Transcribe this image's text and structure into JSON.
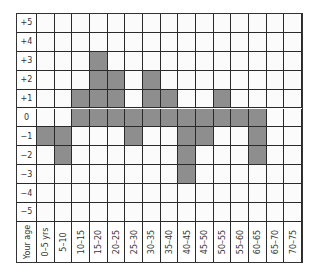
{
  "chart_data": {
    "type": "heatmap",
    "title": "",
    "xlabel": "Your age",
    "ylabel": "",
    "rows": [
      "+5",
      "+4",
      "+3",
      "+2",
      "+1",
      "0",
      "−1",
      "−2",
      "−3",
      "−4",
      "−5"
    ],
    "columns": [
      "0–5 yrs",
      "5–10",
      "10–15",
      "15–20",
      "20–25",
      "25–30",
      "30–35",
      "35–40",
      "40–45",
      "45–50",
      "50–55",
      "55–60",
      "60–65",
      "65–70",
      "70–75"
    ],
    "filled_cells": {
      "+5": [],
      "+4": [],
      "+3": [
        "15–20"
      ],
      "+2": [
        "15–20",
        "20–25",
        "30–35"
      ],
      "+1": [
        "10–15",
        "15–20",
        "20–25",
        "30–35",
        "35–40",
        "50–55"
      ],
      "0": [
        "10–15",
        "15–20",
        "20–25",
        "25–30",
        "30–35",
        "35–40",
        "40–45",
        "45–50",
        "50–55",
        "55–60",
        "60–65"
      ],
      "−1": [
        "0–5 yrs",
        "5–10",
        "25–30",
        "40–45",
        "45–50",
        "60–65"
      ],
      "−2": [
        "5–10",
        "40–45",
        "60–65"
      ],
      "−3": [
        "40–45"
      ],
      "−4": [],
      "−5": []
    },
    "values_by_age": [
      {
        "age": "0–5 yrs",
        "from": 0,
        "to": -1
      },
      {
        "age": "5–10",
        "from": 0,
        "to": -2
      },
      {
        "age": "10–15",
        "from": 0,
        "to": 1
      },
      {
        "age": "15–20",
        "from": 0,
        "to": 3
      },
      {
        "age": "20–25",
        "from": 0,
        "to": 2
      },
      {
        "age": "25–30",
        "from": 0,
        "to": -1
      },
      {
        "age": "30–35",
        "from": 0,
        "to": 2
      },
      {
        "age": "35–40",
        "from": 0,
        "to": 1
      },
      {
        "age": "40–45",
        "from": 0,
        "to": -3
      },
      {
        "age": "45–50",
        "from": 0,
        "to": -1
      },
      {
        "age": "50–55",
        "from": 0,
        "to": 1
      },
      {
        "age": "55–60",
        "from": 0,
        "to": 0
      },
      {
        "age": "60–65",
        "from": 0,
        "to": -2
      },
      {
        "age": "65–70",
        "from": null,
        "to": null
      },
      {
        "age": "70–75",
        "from": null,
        "to": null
      }
    ],
    "ylim": [
      -5,
      5
    ],
    "grid": true,
    "colors": {
      "filled": "#8e8e8e",
      "empty": "#fbfbfb",
      "gridline": "#2a2a2a"
    }
  }
}
